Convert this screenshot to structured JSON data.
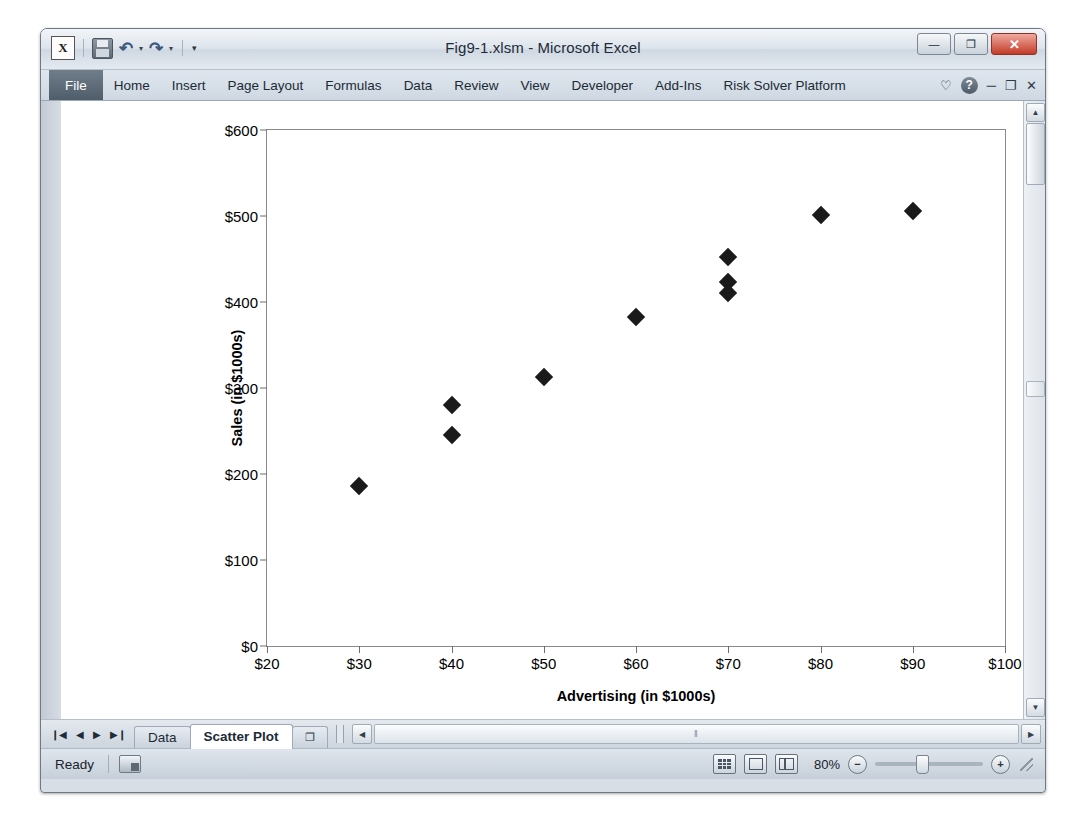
{
  "window": {
    "title": "Fig9-1.xlsm - Microsoft Excel",
    "logo_label": "X",
    "quick_access": [
      {
        "name": "save-icon",
        "label": ""
      },
      {
        "name": "undo-icon",
        "label": "↶"
      },
      {
        "name": "redo-icon",
        "label": "↷"
      },
      {
        "name": "customize-qat-icon",
        "label": "▾"
      }
    ],
    "buttons": {
      "minimize": "—",
      "restore": "❐",
      "close": "✕"
    }
  },
  "ribbon": {
    "tabs": [
      {
        "label": "File",
        "active": false,
        "is_file": true
      },
      {
        "label": "Home",
        "active": false,
        "is_file": false
      },
      {
        "label": "Insert",
        "active": false,
        "is_file": false
      },
      {
        "label": "Page Layout",
        "active": false,
        "is_file": false
      },
      {
        "label": "Formulas",
        "active": false,
        "is_file": false
      },
      {
        "label": "Data",
        "active": false,
        "is_file": false
      },
      {
        "label": "Review",
        "active": false,
        "is_file": false
      },
      {
        "label": "View",
        "active": false,
        "is_file": false
      },
      {
        "label": "Developer",
        "active": false,
        "is_file": false
      },
      {
        "label": "Add-Ins",
        "active": false,
        "is_file": false
      },
      {
        "label": "Risk Solver Platform",
        "active": false,
        "is_file": false
      }
    ],
    "right_icons": [
      {
        "name": "heart-icon",
        "glyph": "♡"
      },
      {
        "name": "help-icon",
        "glyph": "?"
      },
      {
        "name": "minimize-ribbon-icon",
        "glyph": "─"
      },
      {
        "name": "restore-window-icon",
        "glyph": "❐"
      },
      {
        "name": "close-window-icon",
        "glyph": "✕"
      }
    ]
  },
  "chart_data": {
    "type": "scatter",
    "title": "",
    "xlabel": "Advertising (in $1000s)",
    "ylabel": "Sales (in $1000s)",
    "xlim": [
      20,
      100
    ],
    "ylim": [
      0,
      600
    ],
    "xticks": [
      20,
      30,
      40,
      50,
      60,
      70,
      80,
      90,
      100
    ],
    "xticklabels": [
      "$20",
      "$30",
      "$40",
      "$50",
      "$60",
      "$70",
      "$80",
      "$90",
      "$100"
    ],
    "yticks": [
      0,
      100,
      200,
      300,
      400,
      500,
      600
    ],
    "yticklabels": [
      "$0",
      "$100",
      "$200",
      "$300",
      "$400",
      "$500",
      "$600"
    ],
    "grid": false,
    "legend": false,
    "marker": "diamond",
    "marker_color": "#1a1a1a",
    "points": [
      {
        "x": 30,
        "y": 186
      },
      {
        "x": 40,
        "y": 280
      },
      {
        "x": 40,
        "y": 245
      },
      {
        "x": 50,
        "y": 313
      },
      {
        "x": 60,
        "y": 383
      },
      {
        "x": 70,
        "y": 452
      },
      {
        "x": 70,
        "y": 423
      },
      {
        "x": 70,
        "y": 411
      },
      {
        "x": 80,
        "y": 501
      },
      {
        "x": 90,
        "y": 506
      }
    ]
  },
  "sheet_tabs": {
    "nav": [
      {
        "name": "first-sheet-button",
        "glyph": "❙◀"
      },
      {
        "name": "prev-sheet-button",
        "glyph": "◀"
      },
      {
        "name": "next-sheet-button",
        "glyph": "▶"
      },
      {
        "name": "last-sheet-button",
        "glyph": "▶❙"
      }
    ],
    "tabs": [
      {
        "label": "Data",
        "active": false
      },
      {
        "label": "Scatter Plot",
        "active": true
      }
    ],
    "new_sheet_label": "❐"
  },
  "scrollbars": {
    "h_left_arrow": "◀",
    "h_right_arrow": "▶",
    "v_up_arrow": "▲",
    "v_down_arrow": "▼",
    "h_thumb_grip": "‖"
  },
  "status_bar": {
    "state": "Ready",
    "zoom_level": "80%",
    "zoom_out_glyph": "−",
    "zoom_in_glyph": "+",
    "view_buttons": [
      {
        "name": "normal-view-button"
      },
      {
        "name": "page-layout-view-button"
      },
      {
        "name": "page-break-preview-button"
      }
    ]
  }
}
